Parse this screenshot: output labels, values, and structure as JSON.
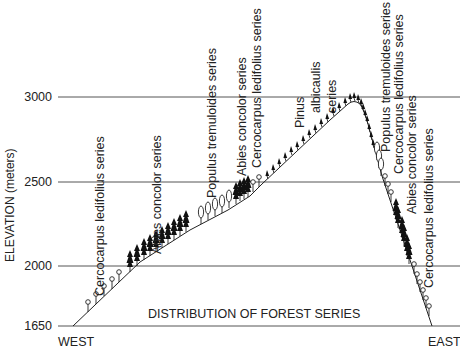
{
  "diagram": {
    "caption": "DISTRIBUTION OF FOREST SERIES",
    "y_axis": {
      "title": "ELEVATION (meters)",
      "ticks": [
        "3000",
        "2500",
        "2000",
        "1650"
      ]
    },
    "x_axis": {
      "left_label": "WEST",
      "right_label": "EAST"
    },
    "west_slope_series": [
      "Cercocarpus ledifolius series",
      "Abies concolor series",
      "Populus tremuloides series",
      "Abies concolor series",
      "Cercocarpus ledifolius series"
    ],
    "summit_series": [
      "Pinus",
      "albicaulis",
      "series"
    ],
    "east_slope_series": [
      "Populus tremuloides series",
      "Cercocarpus ledifolius series",
      "Abies concolor series",
      "Cercocarpus ledifolius series"
    ],
    "symbols": {
      "cercocarpus": "open-circle-shrub-icon",
      "abies": "filled-conifer-icon",
      "populus": "open-oval-tree-icon",
      "pinus": "small-leaning-pine-icon"
    },
    "colors": {
      "ink": "#222222",
      "grid": "#555555",
      "background": "#ffffff"
    }
  }
}
